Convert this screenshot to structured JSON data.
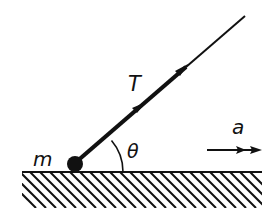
{
  "diagram": {
    "type": "physics-free-body",
    "labels": {
      "mass": "m",
      "tension": "T",
      "angle": "θ",
      "acceleration": "a"
    },
    "colors": {
      "ink": "#111111",
      "background": "#ffffff"
    },
    "elements": [
      {
        "id": "ground",
        "kind": "hatched-surface"
      },
      {
        "id": "mass",
        "kind": "point-mass",
        "label": "m"
      },
      {
        "id": "rope",
        "kind": "string-with-tension-arrows",
        "label": "T"
      },
      {
        "id": "angle",
        "kind": "angle-arc",
        "label": "θ"
      },
      {
        "id": "accel-arrow",
        "kind": "arrow",
        "direction": "right",
        "label": "a"
      }
    ]
  }
}
